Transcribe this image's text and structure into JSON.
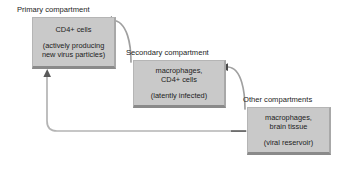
{
  "diagram": {
    "background_color": "#ffffff",
    "box_fill_color": "#c9c9c9",
    "text_color": "#1c1c1c",
    "arrow_color": "#9a9a9a",
    "arrowhead_color": "#4a4a4a"
  },
  "compartments": [
    {
      "id": "primary",
      "group_label": "Primary compartment",
      "cell_types": "CD4+ cells",
      "state": "(actively producing",
      "state_line2": "new virus particles)"
    },
    {
      "id": "secondary",
      "group_label": "Secondary compartment",
      "cell_types": "macrophages,",
      "cell_types_line2": "CD4+ cells",
      "state": "(latently infected)"
    },
    {
      "id": "other",
      "group_label": "Other compartments",
      "cell_types": "macrophages,",
      "cell_types_line2": "brain tissue",
      "state": "(viral reservoir)"
    }
  ],
  "connections": [
    {
      "id": "secondary-to-primary",
      "from": "secondary",
      "to": "primary",
      "style": "curved-arrow"
    },
    {
      "id": "other-to-secondary",
      "from": "other",
      "to": "secondary",
      "style": "curved-arrow"
    },
    {
      "id": "other-to-primary-feedback",
      "from": "other",
      "to": "primary",
      "style": "long-feedback-loop"
    }
  ]
}
